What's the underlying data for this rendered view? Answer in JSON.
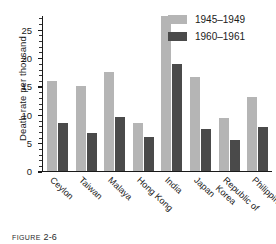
{
  "chart_data": {
    "type": "bar",
    "title": "",
    "xlabel": "",
    "ylabel": "Death rate per thousand",
    "ylim": [
      0,
      27.5
    ],
    "ytick_labels": [
      "0",
      "5",
      "10",
      "15",
      "20",
      "25"
    ],
    "ytick_values": [
      0,
      5,
      10,
      15,
      20,
      25
    ],
    "minor_tick_step": 1,
    "grid": false,
    "legend_position": "top-right",
    "categories": [
      "Ceylon",
      "Taiwan",
      "Malaya",
      "Hong Kong",
      "India",
      "Japan",
      "Republic of Korea",
      "Philippines"
    ],
    "category_lines": [
      [
        "Ceylon",
        ""
      ],
      [
        "Taiwan",
        ""
      ],
      [
        "Malaya",
        ""
      ],
      [
        "Hong Kong",
        ""
      ],
      [
        "India",
        ""
      ],
      [
        "Japan",
        ""
      ],
      [
        "Republic of",
        "Korea"
      ],
      [
        "Philippines",
        ""
      ]
    ],
    "series": [
      {
        "name": "1945–1949",
        "color": "#b5b5b5",
        "values": [
          15.9,
          15.0,
          17.5,
          8.5,
          27.3,
          16.6,
          9.3,
          13.0
        ]
      },
      {
        "name": "1960–1961",
        "color": "#4a4a4a",
        "values": [
          8.4,
          6.7,
          9.5,
          6.0,
          18.8,
          7.4,
          5.4,
          7.8
        ]
      }
    ]
  },
  "legend": {
    "items": [
      {
        "label": "1945–1949",
        "color": "#b5b5b5"
      },
      {
        "label": "1960–1961",
        "color": "#4a4a4a"
      }
    ]
  },
  "caption": {
    "word": "FIGURE",
    "number": "2-6"
  }
}
